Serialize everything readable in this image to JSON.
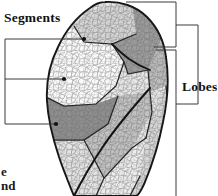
{
  "figure": {
    "kind": "anatomical-illustration",
    "background_color": "#ffffff",
    "ink_color": "#1a1a1a"
  },
  "labels": {
    "segments": "Segments",
    "lobes": "Lobes"
  },
  "caption_fragments": {
    "line_1": "e",
    "line_2": "nd"
  },
  "leader_lines": {
    "left_bracket": {
      "spine_x": 5,
      "top_y": 39,
      "bottom_y": 124,
      "rows": [
        {
          "name": "segment-pointer-upper",
          "y": 39,
          "end_x": 83,
          "dot": true
        },
        {
          "name": "segment-pointer-middle",
          "y": 79,
          "end_x": 63,
          "dot": true
        },
        {
          "name": "segment-pointer-lower",
          "y": 124,
          "end_x": 55,
          "dot": true
        }
      ]
    },
    "right_brackets": {
      "inner_spine_x": 176,
      "outer_spine_x": 198,
      "upper_group": {
        "top_y": 2,
        "bottom_y": 47
      },
      "lower_group": {
        "top_y": 50,
        "bottom_y": 196
      },
      "outer_group": {
        "top_y": 25,
        "bottom_y": 104
      }
    }
  },
  "shading": {
    "white": "#fdfdfd",
    "very_light_gray": "#efefef",
    "light_gray": "#e2e2e2",
    "mid_light_gray": "#d2d2d2",
    "mid_gray": "#b9b9b9",
    "dark_gray": "#999999",
    "darker_gray": "#8a8a8a"
  },
  "segments": [
    {
      "name": "apical-segment",
      "tone": "#d6d6d6"
    },
    {
      "name": "anterior-segment",
      "tone": "#fbfbfb"
    },
    {
      "name": "posterior-segment",
      "tone": "#9c9c9c"
    },
    {
      "name": "superior-lingular-segment",
      "tone": "#c9c9c9"
    },
    {
      "name": "inferior-lingular-segment",
      "tone": "#8f8f8f"
    },
    {
      "name": "anterior-basal-segment",
      "tone": "#e6e6e6"
    },
    {
      "name": "lateral-basal-segment",
      "tone": "#dcdcdc"
    },
    {
      "name": "posterior-basal-segment",
      "tone": "#cfcfcf"
    },
    {
      "name": "medial-basal-segment",
      "tone": "#b4b4b4"
    }
  ]
}
